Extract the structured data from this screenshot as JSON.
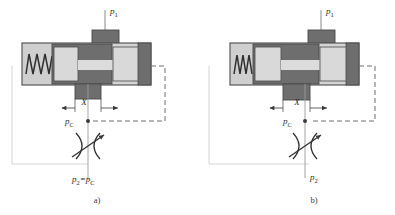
{
  "figure": {
    "type": "hydraulic-schematic",
    "subfigures": [
      {
        "id": "a",
        "caption": "a)",
        "origin_x": 0,
        "spool_shift": 0,
        "spring_compressed": false,
        "labels": {
          "inlet": "p",
          "inlet_sub": "1",
          "gap": "X",
          "control": "p",
          "control_sub": "C",
          "outlet": "p₂=p",
          "outlet_main": "p",
          "outlet_sub": "2",
          "outlet_eq": "=p",
          "outlet_sub2": "C"
        }
      },
      {
        "id": "b",
        "caption": "b)",
        "origin_x": 197,
        "spool_shift": 14,
        "spring_compressed": true,
        "labels": {
          "inlet": "p",
          "inlet_sub": "1",
          "gap": "X",
          "control": "p",
          "control_sub": "C",
          "outlet_main": "p",
          "outlet_sub": "2"
        }
      }
    ]
  },
  "colors": {
    "spool_dark": "#6e6e6e",
    "chamber_light": "#d4d4d4",
    "body_outline": "#4a4a4a",
    "spring_chamber": "#cfcfcf",
    "line_dark": "#3a3a3a",
    "line_faint": "#c9c9c9",
    "dashed_pilot": "#6f6f6f",
    "background": "#ffffff"
  },
  "elements": {
    "spring_name": "return-spring",
    "spool_name": "valve-spool",
    "body_name": "valve-body",
    "orifice_name": "variable-orifice",
    "pilot_name": "pilot-feedback-line",
    "inlet_arrow_name": "inlet-pressure-arrow",
    "gap_dim_name": "gap-dimension-X"
  }
}
